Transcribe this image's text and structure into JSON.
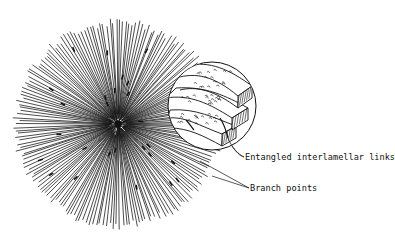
{
  "diagram": {
    "type": "spherulite-schematic",
    "spherulite": {
      "cx": 118,
      "cy": 124,
      "r": 105,
      "ray_count": 190,
      "color": "#111111"
    },
    "magnifier": {
      "cx": 212,
      "cy": 106,
      "r": 44
    },
    "labels": {
      "entangled": "Entangled interlamellar links",
      "branch": "Branch points"
    }
  }
}
